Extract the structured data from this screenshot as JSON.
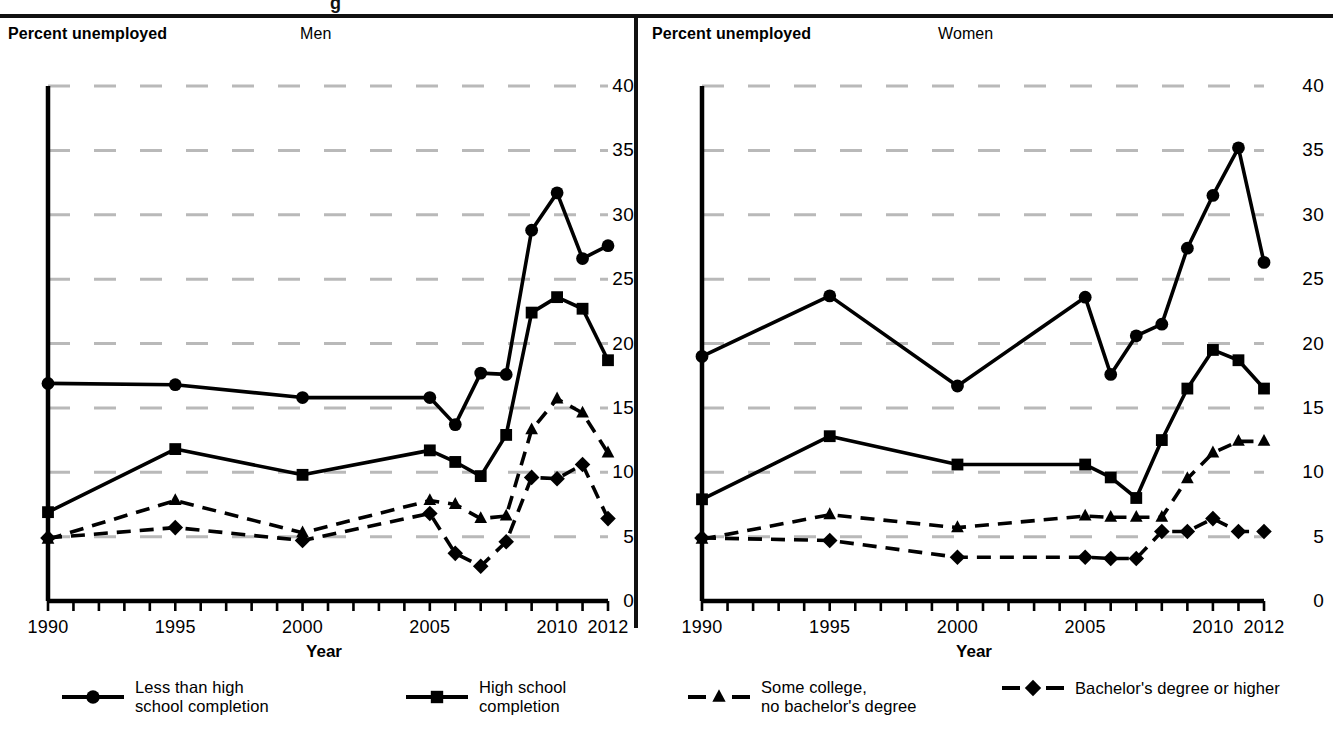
{
  "figure": {
    "top_partial_text": "g",
    "panels": [
      {
        "id": "men",
        "axis_caption": "Percent unemployed",
        "title": "Men",
        "xlabel": "Year"
      },
      {
        "id": "women",
        "axis_caption": "Percent unemployed",
        "title": "Women",
        "xlabel": "Year"
      }
    ]
  },
  "legend": {
    "items": [
      {
        "name": "less-than-high-school",
        "label": "Less than high\nschool completion",
        "marker": "circle",
        "line": "solid"
      },
      {
        "name": "high-school",
        "label": "High school\ncompletion",
        "marker": "square",
        "line": "solid"
      },
      {
        "name": "some-college",
        "label": "Some college,\nno bachelor's degree",
        "marker": "triangle",
        "line": "dashed"
      },
      {
        "name": "bachelors-or-higher",
        "label": "Bachelor's degree or higher",
        "marker": "diamond",
        "line": "dashed"
      }
    ]
  },
  "chart_data": [
    {
      "type": "line",
      "title": "Men",
      "xlabel": "Year",
      "ylabel": "Percent unemployed",
      "xlim": [
        1990,
        2012
      ],
      "ylim": [
        0,
        40
      ],
      "ytick_labels": [
        "0",
        "5",
        "10",
        "15",
        "20",
        "25",
        "30",
        "35",
        "40"
      ],
      "yticks": [
        0,
        5,
        10,
        15,
        20,
        25,
        30,
        35,
        40
      ],
      "xtick_labels": [
        "1990",
        "1995",
        "2000",
        "2005",
        "2010",
        "2012"
      ],
      "xticks_labeled": [
        1990,
        1995,
        2000,
        2005,
        2010,
        2012
      ],
      "minor_xticks_every": 1,
      "grid": "horizontal-dashed",
      "legend_position": "below-figure",
      "x": [
        1990,
        1995,
        2000,
        2005,
        2006,
        2007,
        2008,
        2009,
        2010,
        2011,
        2012
      ],
      "series": [
        {
          "name": "Less than high school completion",
          "marker": "circle",
          "line": "solid",
          "values": [
            16.9,
            16.8,
            15.8,
            15.8,
            13.7,
            17.7,
            17.6,
            28.8,
            31.7,
            26.6,
            27.6
          ]
        },
        {
          "name": "High school completion",
          "marker": "square",
          "line": "solid",
          "values": [
            6.9,
            11.8,
            9.8,
            11.7,
            10.8,
            9.7,
            12.9,
            22.4,
            23.6,
            22.7,
            18.7
          ]
        },
        {
          "name": "Some college, no bachelor's degree",
          "marker": "triangle",
          "line": "dashed",
          "values": [
            4.8,
            7.8,
            5.3,
            7.8,
            7.5,
            6.4,
            6.6,
            13.3,
            15.7,
            14.6,
            11.5
          ]
        },
        {
          "name": "Bachelor's degree or higher",
          "marker": "diamond",
          "line": "dashed",
          "values": [
            4.9,
            5.7,
            4.7,
            6.8,
            3.7,
            2.7,
            4.6,
            9.6,
            9.5,
            10.6,
            6.4
          ]
        }
      ]
    },
    {
      "type": "line",
      "title": "Women",
      "xlabel": "Year",
      "ylabel": "Percent unemployed",
      "xlim": [
        1990,
        2012
      ],
      "ylim": [
        0,
        40
      ],
      "ytick_labels": [
        "0",
        "5",
        "10",
        "15",
        "20",
        "25",
        "30",
        "35",
        "40"
      ],
      "yticks": [
        0,
        5,
        10,
        15,
        20,
        25,
        30,
        35,
        40
      ],
      "xtick_labels": [
        "1990",
        "1995",
        "2000",
        "2005",
        "2010",
        "2012"
      ],
      "xticks_labeled": [
        1990,
        1995,
        2000,
        2005,
        2010,
        2012
      ],
      "minor_xticks_every": 1,
      "grid": "horizontal-dashed",
      "legend_position": "below-figure",
      "x": [
        1990,
        1995,
        2000,
        2005,
        2006,
        2007,
        2008,
        2009,
        2010,
        2011,
        2012
      ],
      "series": [
        {
          "name": "Less than high school completion",
          "marker": "circle",
          "line": "solid",
          "values": [
            19.0,
            23.7,
            16.7,
            23.6,
            17.6,
            20.6,
            21.5,
            27.4,
            31.5,
            35.2,
            26.3
          ]
        },
        {
          "name": "High school completion",
          "marker": "square",
          "line": "solid",
          "values": [
            7.9,
            12.8,
            10.6,
            10.6,
            9.6,
            8.0,
            12.5,
            16.5,
            19.5,
            18.7,
            16.5
          ]
        },
        {
          "name": "Some college, no bachelor's degree",
          "marker": "triangle",
          "line": "dashed",
          "values": [
            4.8,
            6.7,
            5.7,
            6.6,
            6.5,
            6.5,
            6.5,
            9.5,
            11.5,
            12.4,
            12.4
          ]
        },
        {
          "name": "Bachelor's degree or higher",
          "marker": "diamond",
          "line": "dashed",
          "values": [
            4.9,
            4.7,
            3.4,
            3.4,
            3.3,
            3.3,
            5.4,
            5.4,
            6.4,
            5.4,
            5.4
          ]
        }
      ]
    }
  ],
  "colors": {
    "ink": "#000000",
    "grid": "#b9b9b9",
    "background": "#ffffff"
  }
}
